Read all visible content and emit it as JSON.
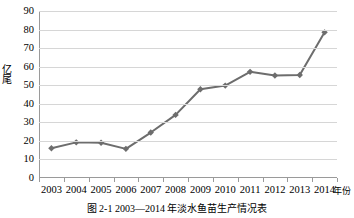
{
  "chart_data": {
    "type": "line",
    "title": "",
    "xlabel": "年份",
    "ylabel": "亿尾",
    "categories": [
      "2003",
      "2004",
      "2005",
      "2006",
      "2007",
      "2008",
      "2009",
      "2010",
      "2011",
      "2012",
      "2013",
      "2014"
    ],
    "values": [
      16.0,
      19.2,
      19.0,
      15.7,
      24.5,
      34.0,
      47.8,
      49.8,
      57.2,
      55.2,
      55.5,
      78.5
    ],
    "series": [
      {
        "name": "淡水鱼苗产量",
        "values": [
          16.0,
          19.2,
          19.0,
          15.7,
          24.5,
          34.0,
          47.8,
          49.8,
          57.2,
          55.2,
          55.5,
          78.5
        ]
      }
    ],
    "ylim": [
      0,
      90
    ],
    "yticks": [
      0,
      10,
      20,
      30,
      40,
      50,
      60,
      70,
      80,
      90
    ],
    "ytick_labels": [
      "0",
      "10",
      "20",
      "30",
      "40",
      "50",
      "60",
      "70",
      "80",
      "90"
    ],
    "grid": true,
    "grid_axis": "y",
    "legend": false,
    "legend_position": "none",
    "line_color": "#6d6d6d",
    "marker": "diamond",
    "marker_color": "#6d6d6d",
    "grid_color": "#d6d6d6",
    "axis_color": "#9a9a9a",
    "background": "#ffffff"
  },
  "caption": {
    "text": "图 2-1  2003—2014 年淡水鱼苗生产情况表"
  }
}
